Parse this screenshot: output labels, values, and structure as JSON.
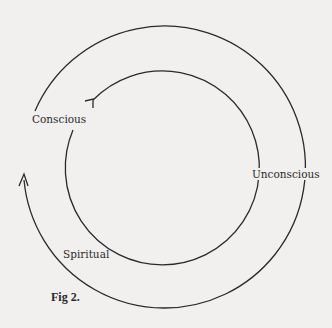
{
  "diagram": {
    "labels": {
      "conscious": "Conscious",
      "unconscious": "Unconscious",
      "spiritual": "Spiritual"
    },
    "caption": "Fig 2.",
    "circles": [
      {
        "name": "outer-spiral-arc",
        "cx": 165,
        "cy": 165,
        "r": 141,
        "arrow": "upward at left end"
      },
      {
        "name": "inner-circle-arc",
        "cx": 165,
        "cy": 166,
        "r": 97,
        "arrow": "clockwise near Conscious"
      }
    ],
    "colors": {
      "background": "#f1f0ee",
      "stroke": "#2a2a2a"
    }
  }
}
